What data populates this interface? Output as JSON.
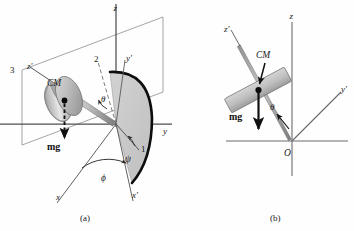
{
  "figure": {
    "background": "#fefefe",
    "colors": {
      "axis": "#58585c",
      "plane_edge": "#8a8a90",
      "fan_fill": "#c9c9c9",
      "fan_edge": "#0d0d0d",
      "disk_light": "#e2e2e2",
      "disk_mid": "#b9b9b9",
      "disk_dark": "#8e8e8e",
      "rod": "#a9a9a9",
      "text": "#1a1a1a",
      "arrow": "#111111"
    }
  },
  "panel_a": {
    "caption": "(a)",
    "axes": [
      {
        "name": "z-axis",
        "label": "z"
      },
      {
        "name": "y-axis",
        "label": "y"
      },
      {
        "name": "x-axis",
        "label": "x"
      },
      {
        "name": "x-prime-axis",
        "label": "x′"
      },
      {
        "name": "y-prime-axis",
        "label": "y′"
      },
      {
        "name": "z-prime-axis",
        "label": "z′"
      }
    ],
    "labels": {
      "z": "z",
      "y": "y",
      "x": "x",
      "x_prime": "x′",
      "y_prime": "y′",
      "z_prime": "z′",
      "cm": "CM",
      "weight": "mg",
      "theta": "θ",
      "phi": "ϕ",
      "psi": "ψ",
      "line_1": "1",
      "line_2": "2",
      "line_3": "3"
    }
  },
  "panel_b": {
    "caption": "(b)",
    "axes": [
      {
        "name": "z-axis",
        "label": "z"
      },
      {
        "name": "y-prime-axis",
        "label": "y′"
      },
      {
        "name": "z-prime-axis",
        "label": "z′"
      }
    ],
    "labels": {
      "z": "z",
      "y_prime": "y′",
      "z_prime": "z′",
      "cm": "CM",
      "weight": "mg",
      "theta": "θ",
      "origin": "O"
    }
  }
}
